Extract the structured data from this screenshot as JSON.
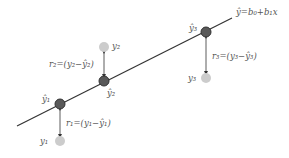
{
  "diagram": {
    "regression_line": {
      "label_main": "ŷ",
      "label_eq": "=b₀+b₁x",
      "color": "#333333"
    },
    "fitted_points": [
      {
        "label": "ŷ₁",
        "color": "#595959"
      },
      {
        "label": "ŷ₂",
        "color": "#595959"
      },
      {
        "label": "ŷ₃",
        "color": "#595959"
      }
    ],
    "observed_points": [
      {
        "label": "y₁",
        "color": "#cccccc"
      },
      {
        "label": "y₂",
        "color": "#cccccc"
      },
      {
        "label": "y₃",
        "color": "#cccccc"
      }
    ],
    "residuals": [
      {
        "label": "r₁=(y₁−ŷ₁)"
      },
      {
        "label": "r₂=(y₂−ŷ₂)"
      },
      {
        "label": "r₃=(y₃−ŷ₃)"
      }
    ]
  }
}
